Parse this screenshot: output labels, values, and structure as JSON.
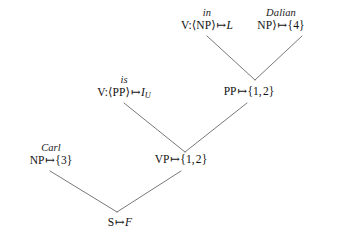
{
  "diagram": {
    "type": "parse-tree",
    "background_color": "#ffffff",
    "text_color": "#1a1a1a",
    "edge_color": "#555555",
    "maps_to_symbol": "↦"
  },
  "nodes": {
    "v_np": {
      "gloss": "in",
      "label": "V:⟨NP⟩ ↦ L",
      "category": "V:⟨NP⟩",
      "value": "L",
      "x": 172,
      "y": 8
    },
    "np_dalian": {
      "gloss": "Dalian",
      "label": "NP⟩ ↦ {4}",
      "category": "NP⟩",
      "value": "{4}",
      "x": 250,
      "y": 8
    },
    "v_pp": {
      "gloss": "is",
      "label": "V:⟨PP⟩ ↦ I_U",
      "category": "V:⟨PP⟩",
      "value": "I",
      "value_subscript": "U",
      "x": 90,
      "y": 75
    },
    "pp": {
      "gloss": "",
      "label": "PP ↦ {1, 2}",
      "category": "PP",
      "value": "{1, 2}",
      "x": 218,
      "y": 86
    },
    "np_carl": {
      "gloss": "Carl",
      "label": "NP ↦ {3}",
      "category": "NP",
      "value": "{3}",
      "x": 18,
      "y": 143
    },
    "vp": {
      "gloss": "",
      "label": "VP ↦ {1, 2}",
      "category": "VP",
      "value": "{1, 2}",
      "x": 148,
      "y": 154
    },
    "s": {
      "gloss": "",
      "label": "S ↦ F",
      "category": "S",
      "value": "F",
      "x": 110,
      "y": 217
    }
  },
  "edges": [
    {
      "name": "edge-v-np-to-pp",
      "x1": 207,
      "y1": 36,
      "x2": 255,
      "y2": 80
    },
    {
      "name": "edge-np-dalian-to-pp",
      "x1": 302,
      "y1": 36,
      "x2": 255,
      "y2": 80
    },
    {
      "name": "edge-v-pp-to-vp",
      "x1": 124,
      "y1": 103,
      "x2": 185,
      "y2": 152
    },
    {
      "name": "edge-pp-to-vp",
      "x1": 247,
      "y1": 103,
      "x2": 185,
      "y2": 152
    },
    {
      "name": "edge-np-carl-to-s",
      "x1": 50,
      "y1": 171,
      "x2": 117,
      "y2": 212
    },
    {
      "name": "edge-vp-to-s",
      "x1": 181,
      "y1": 171,
      "x2": 117,
      "y2": 212
    }
  ]
}
